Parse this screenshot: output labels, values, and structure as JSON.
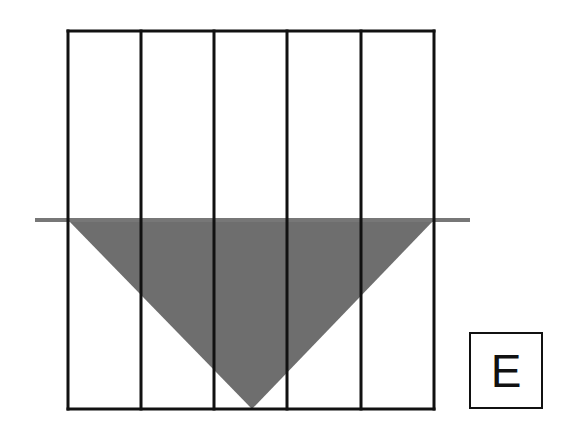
{
  "diagram": {
    "grid": {
      "columns": 5,
      "x_lines": [
        68,
        141,
        214,
        287,
        361,
        434
      ],
      "top": 31,
      "bottom": 409,
      "stroke": "#111111"
    },
    "water_line": {
      "y": 220,
      "x1": 35,
      "x2": 470,
      "color": "#777777"
    },
    "triangle": {
      "points": [
        [
          68,
          220
        ],
        [
          434,
          220
        ],
        [
          252,
          409
        ]
      ],
      "fill": "#6e6e6e"
    },
    "label": "E"
  }
}
